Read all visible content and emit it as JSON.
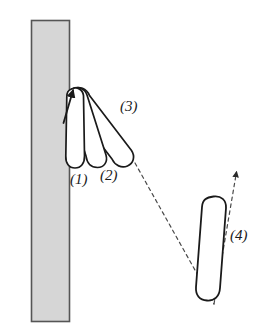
{
  "figure": {
    "type": "physics-motion-diagram",
    "background_color": "#ffffff",
    "stroke_color": "#1a1a1a",
    "wall": {
      "name": "vertical wall",
      "fill_color": "#d6d6d6",
      "border_color": "#555555",
      "x": 31,
      "y": 20,
      "width": 39,
      "height": 302
    },
    "pivot": {
      "x": 72,
      "y": 89,
      "label": ""
    },
    "rods": [
      {
        "id": 1,
        "label": "(1)",
        "angle_deg": 4,
        "length": 81,
        "width": 15,
        "tip_x": 77,
        "tip_y": 168
      },
      {
        "id": 2,
        "label": "(2)",
        "angle_deg": 16,
        "length": 82,
        "width": 15,
        "tip_x": 99,
        "tip_y": 166
      },
      {
        "id": 3,
        "label": "(3)",
        "angle_deg": 38,
        "length": 88,
        "width": 15,
        "tip_x": 128,
        "tip_y": 158
      },
      {
        "id": 4,
        "label": "(4)",
        "angle_deg": 7,
        "length": 95,
        "width": 18,
        "tip_x": 205,
        "tip_y": 293
      }
    ],
    "pivot_arrow": {
      "name": "contact force arrow",
      "from_x": 64,
      "from_y": 122,
      "to_x": 73,
      "to_y": 89,
      "style": "solid"
    },
    "trajectory": {
      "name": "dashed trajectory",
      "style": "dashed",
      "vertex_x": 214,
      "vertex_y": 304,
      "from_x": 135,
      "from_y": 163,
      "arrow_x": 236,
      "arrow_y": 170
    },
    "labels": {
      "one": "(1)",
      "two": "(2)",
      "three": "(3)",
      "four": "(4)"
    }
  }
}
